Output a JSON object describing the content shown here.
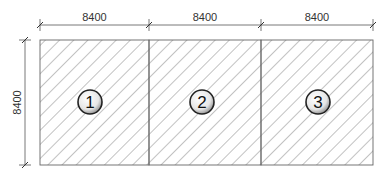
{
  "diagram": {
    "type": "floor-plan-grid",
    "bays": [
      {
        "label": "1",
        "width": "8400"
      },
      {
        "label": "2",
        "width": "8400"
      },
      {
        "label": "3",
        "width": "8400"
      }
    ],
    "top_dimensions": [
      "8400",
      "8400",
      "8400"
    ],
    "left_dimension": "8400",
    "colors": {
      "line": "#555555",
      "hatch": "#777777",
      "background": "#ffffff"
    }
  }
}
